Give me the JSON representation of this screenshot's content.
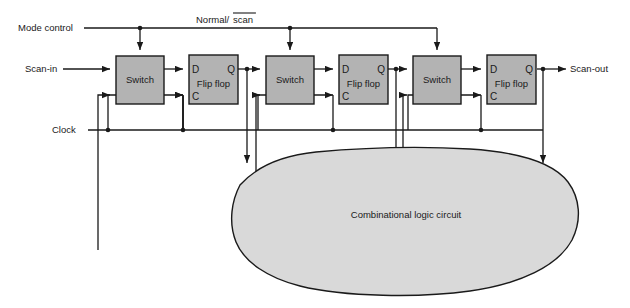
{
  "diagram": {
    "type": "digital-logic-block-diagram",
    "canvas": {
      "width": 630,
      "height": 308,
      "background": "#ffffff"
    },
    "colors": {
      "block_fill": "#b3b3b3",
      "block_stroke": "#1a1a1a",
      "cloud_fill": "#d9d9d9",
      "cloud_stroke": "#1a1a1a",
      "wire": "#1a1a1a",
      "text": "#1a1a1a"
    },
    "labels": {
      "mode_control": "Mode control",
      "normal_scan": "Normal/",
      "normal_scan_overline": "scan",
      "scan_in": "Scan-in",
      "scan_out": "Scan-out",
      "clock": "Clock",
      "combinational": "Combinational logic circuit"
    },
    "blocks": [
      {
        "id": "switch-1",
        "label": "Switch",
        "x": 116,
        "y": 56,
        "w": 48,
        "h": 48
      },
      {
        "id": "flipflop-1",
        "label": "Flip flop",
        "x": 189,
        "y": 55,
        "w": 49,
        "h": 49,
        "pins": {
          "d": "D",
          "q": "Q",
          "c": "C"
        }
      },
      {
        "id": "switch-2",
        "label": "Switch",
        "x": 266,
        "y": 56,
        "w": 48,
        "h": 48
      },
      {
        "id": "flipflop-2",
        "label": "Flip flop",
        "x": 339,
        "y": 55,
        "w": 49,
        "h": 49,
        "pins": {
          "d": "D",
          "q": "Q",
          "c": "C"
        }
      },
      {
        "id": "switch-3",
        "label": "Switch",
        "x": 413,
        "y": 56,
        "w": 48,
        "h": 48
      },
      {
        "id": "flipflop-3",
        "label": "Flip flop",
        "x": 487,
        "y": 55,
        "w": 49,
        "h": 49,
        "pins": {
          "d": "D",
          "q": "Q",
          "c": "C"
        }
      }
    ],
    "stages": 3,
    "signals": [
      "Mode control / Normal-scan select bus feeding all three switches",
      "Scan-in entering switch 1",
      "Scan-out leaving flip flop 3 Q",
      "Clock bus feeding all three flip flop C pins",
      "Flip flop Q outputs feeding combinational logic circuit",
      "Combinational logic circuit outputs feeding switch data inputs"
    ]
  }
}
